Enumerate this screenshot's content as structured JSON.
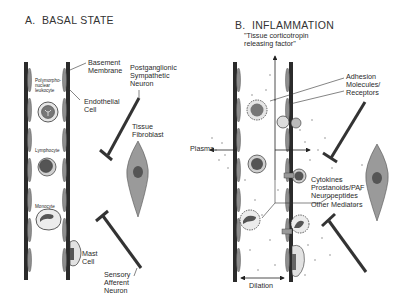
{
  "panel_a": {
    "title": "A.  BASAL STATE",
    "labels": {
      "basement_membrane": "Basement\nMembrane",
      "endothelial_cell": "Endothelial\nCell",
      "pmn": "Polymorpho-\nnuclear\nleukocyte",
      "lymphocyte": "Lymphocyte",
      "monocyte": "Monocyte",
      "mast_cell": "Mast\nCell",
      "sympathetic_neuron": "Postganglionic\nSympathetic\nNeuron",
      "fibroblast": "Tissue\nFibroblast",
      "sensory_neuron": "Sensory\nAfferent\nNeuron"
    }
  },
  "panel_b": {
    "title": "B.  INFLAMMATION",
    "subtitle": "\"Tissue corticotropin\nreleasing factor\"",
    "labels": {
      "adhesion": "Adhesion\nMolecules/\nReceptors",
      "plasma": "Plasma",
      "mediators": "Cytokines\nProstanoids/PAF\nNeuropeptides\nOther Mediators",
      "dilation": "Dilation"
    }
  },
  "colors": {
    "vessel_wall": "#2b2b2b",
    "endothelium": "#8a8a8a",
    "cell_fill": "#d6d6d6",
    "nucleus": "#5a5a5a",
    "neuron": "#333333",
    "text": "#2a2a2a"
  }
}
